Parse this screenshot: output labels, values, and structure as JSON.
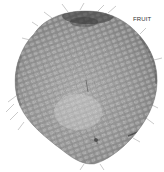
{
  "image": {
    "subject": "fruit",
    "description": "Grayscale micrograph-style image of a rounded fruit with a honeycomb-like textured surface and fine hairs at the edges",
    "label": "FRUIT",
    "colors": {
      "background": "#ffffff",
      "body_light": "#b8b8b8",
      "body_mid": "#8c8c8c",
      "body_dark": "#3a3a3a",
      "label": "#333333"
    }
  }
}
